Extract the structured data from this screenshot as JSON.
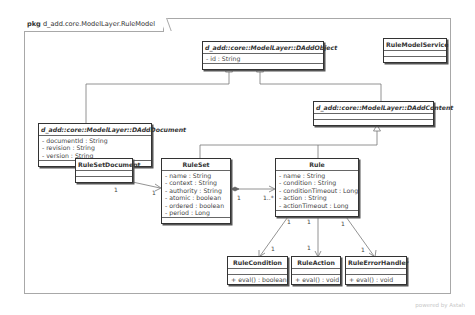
{
  "package": {
    "keyword": "pkg",
    "name": "d_add.core.ModelLayer.RuleModel"
  },
  "classes": {
    "daddobject": {
      "name": "d_add::core::ModelLayer::DAddObject",
      "abstract": true,
      "attributes": [
        "- id : String"
      ],
      "operations": []
    },
    "rulemodelservice": {
      "name": "RuleModelService",
      "abstract": false,
      "attributes": [],
      "operations": []
    },
    "dadddocument": {
      "name": "d_add::core::ModelLayer::DAddDocument",
      "abstract": true,
      "attributes": [
        "- documentId : String",
        "- revision : String",
        "- version : String"
      ],
      "operations": []
    },
    "daddcontent": {
      "name": "d_add::core::ModelLayer::DAddContent",
      "abstract": true,
      "attributes": [],
      "operations": []
    },
    "rulesetdocument": {
      "name": "RuleSetDocument",
      "abstract": false,
      "attributes": [],
      "operations": []
    },
    "ruleset": {
      "name": "RuleSet",
      "abstract": false,
      "attributes": [
        "- name : String",
        "- context : String",
        "- authority : String",
        "- atomic : boolean",
        "- ordered : boolean",
        "- period : Long"
      ],
      "operations": []
    },
    "rule": {
      "name": "Rule",
      "abstract": false,
      "attributes": [
        "- name : String",
        "- condition : String",
        "- conditionTimeout : Long",
        "- action : String",
        "- actionTimeout : Long"
      ],
      "operations": []
    },
    "rulecondition": {
      "name": "RuleCondition",
      "abstract": false,
      "attributes": [],
      "operations": [
        "+ eval() : boolean"
      ]
    },
    "ruleaction": {
      "name": "RuleAction",
      "abstract": false,
      "attributes": [],
      "operations": [
        "+ eval() : void"
      ]
    },
    "ruleerrorhandler": {
      "name": "RuleErrorHandler",
      "abstract": false,
      "attributes": [],
      "operations": [
        "+ eval() : void"
      ]
    }
  },
  "relations": {
    "doc_to_ruleset": {
      "source": "1",
      "target": "1"
    },
    "ruleset_to_rule": {
      "source": "1",
      "target": "1..*"
    },
    "rule_to_condition": {
      "source": "1",
      "target": "1"
    },
    "rule_to_action": {
      "source": "1",
      "target": "1"
    },
    "rule_to_errorhandler": {
      "source": "1",
      "target": "1"
    }
  },
  "footer": "powered by Astah"
}
